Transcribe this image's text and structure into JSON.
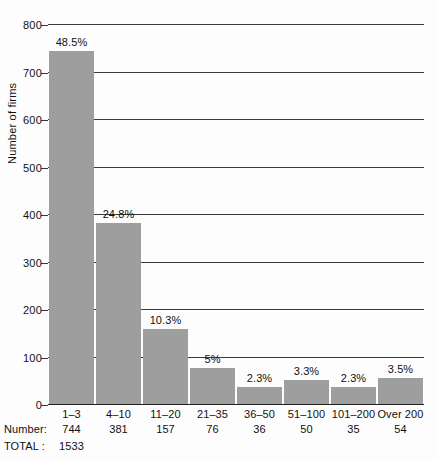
{
  "chart_data": {
    "type": "bar",
    "title": "",
    "subtitle": "",
    "xlabel": "",
    "ylabel": "Number of firms",
    "ylim": [
      0,
      800
    ],
    "ytick_values": [
      0,
      100,
      200,
      300,
      400,
      500,
      600,
      700,
      800
    ],
    "ytick_labels": [
      "0",
      "100",
      "200",
      "300",
      "400",
      "500",
      "600",
      "700",
      "800"
    ],
    "grid": true,
    "legend": null,
    "categories": [
      "1–3",
      "4–10",
      "11–20",
      "21–35",
      "36–50",
      "51–100",
      "101–200",
      "Over 200"
    ],
    "values": [
      744,
      381,
      157,
      76,
      36,
      50,
      35,
      54
    ],
    "data_labels": [
      "48.5%",
      "24.8%",
      "10.3%",
      "5%",
      "2.3%",
      "3.3%",
      "2.3%",
      "3.5%"
    ],
    "bar_color": "#9e9e9e",
    "footer_rows": [
      {
        "label": "Number:",
        "cells": [
          "744",
          "381",
          "157",
          "76",
          "36",
          "50",
          "35",
          "54"
        ]
      },
      {
        "label": "TOTAL :",
        "cells": [
          "1533",
          "",
          "",
          "",
          "",
          "",
          "",
          ""
        ]
      }
    ]
  }
}
